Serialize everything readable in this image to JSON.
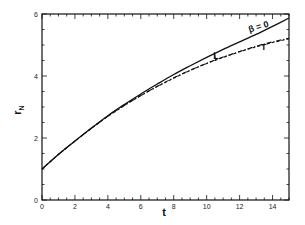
{
  "chart_data": {
    "type": "line",
    "title": "",
    "xlabel": "t",
    "ylabel": "r",
    "ylabel_subscript": "N",
    "xlim": [
      0,
      15
    ],
    "ylim": [
      0,
      6
    ],
    "grid": false,
    "legend": "none (inline annotations)",
    "x_ticks": [
      0,
      2,
      4,
      6,
      8,
      10,
      12,
      14
    ],
    "x_tick_labels": [
      "0",
      "2",
      "4",
      "6",
      "8",
      "10",
      "12",
      "14"
    ],
    "y_ticks": [
      0,
      2,
      4,
      6
    ],
    "y_tick_labels": [
      "0",
      "2",
      "4",
      "6"
    ],
    "x": [
      0,
      1,
      2,
      3,
      4,
      5,
      6,
      7,
      8,
      9,
      10,
      11,
      12,
      13,
      14,
      15
    ],
    "series": [
      {
        "name": "β = 0",
        "style": "solid",
        "values": [
          1.0,
          1.47,
          1.9,
          2.32,
          2.72,
          3.08,
          3.42,
          3.74,
          4.05,
          4.33,
          4.6,
          4.86,
          5.1,
          5.34,
          5.6,
          5.87
        ]
      },
      {
        "name": "L",
        "style": "dashed",
        "values": [
          1.0,
          1.47,
          1.9,
          2.31,
          2.7,
          3.05,
          3.37,
          3.66,
          3.93,
          4.18,
          4.4,
          4.6,
          4.78,
          4.94,
          5.08,
          5.2
        ]
      },
      {
        "name": "T",
        "style": "dash-dot",
        "values": [
          1.0,
          1.47,
          1.9,
          2.31,
          2.7,
          3.05,
          3.37,
          3.67,
          3.94,
          4.19,
          4.41,
          4.61,
          4.79,
          4.96,
          5.1,
          5.22
        ]
      }
    ],
    "annotations": [
      {
        "text": "β = 0",
        "x": 13.2,
        "y": 5.5,
        "target": "β = 0"
      },
      {
        "text": "L",
        "x": 10.4,
        "y": 4.55,
        "target": "L"
      },
      {
        "text": "T",
        "x": 13.3,
        "y": 4.85,
        "target": "T"
      }
    ]
  },
  "labels": {
    "xlabel": "t",
    "ylabel_main": "r",
    "ylabel_sub": "N",
    "beta_annotation": "β = 0",
    "l_annotation": "L",
    "t_annotation": "T"
  }
}
